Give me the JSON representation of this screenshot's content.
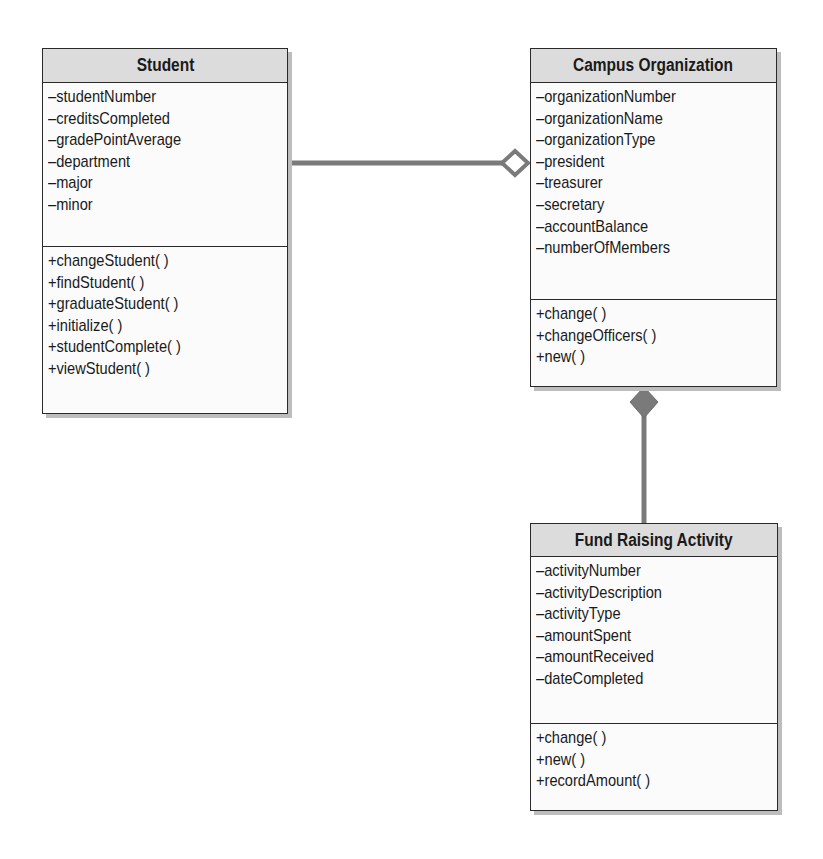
{
  "diagram": {
    "type": "UML class diagram",
    "classes": [
      {
        "name": "Student",
        "attributes": [
          "–studentNumber",
          "–creditsCompleted",
          "–gradePointAverage",
          "–department",
          "–major",
          "–minor"
        ],
        "methods": [
          "+changeStudent( )",
          "+findStudent( )",
          "+graduateStudent( )",
          "+initialize( )",
          "+studentComplete( )",
          "+viewStudent( )"
        ]
      },
      {
        "name": "Campus Organization",
        "attributes": [
          "–organizationNumber",
          "–organizationName",
          "–organizationType",
          "–president",
          "–treasurer",
          "–secretary",
          "–accountBalance",
          "–numberOfMembers"
        ],
        "methods": [
          "+change( )",
          "+changeOfficers( )",
          "+new( )"
        ]
      },
      {
        "name": "Fund Raising Activity",
        "attributes": [
          "–activityNumber",
          "–activityDescription",
          "–activityType",
          "–amountSpent",
          "–amountReceived",
          "–dateCompleted"
        ],
        "methods": [
          "+change( )",
          "+new( )",
          "+recordAmount( )"
        ]
      }
    ],
    "relationships": [
      {
        "from": "Student",
        "to": "Campus Organization",
        "kind": "aggregation",
        "marker": "hollow-diamond"
      },
      {
        "from": "Fund Raising Activity",
        "to": "Campus Organization",
        "kind": "composition",
        "marker": "filled-diamond"
      }
    ],
    "colors": {
      "connector": "#7a7a7a",
      "header_fill": "#dcdcdc",
      "border": "#2a2a2a",
      "shadow": "#bdbdbd"
    }
  }
}
